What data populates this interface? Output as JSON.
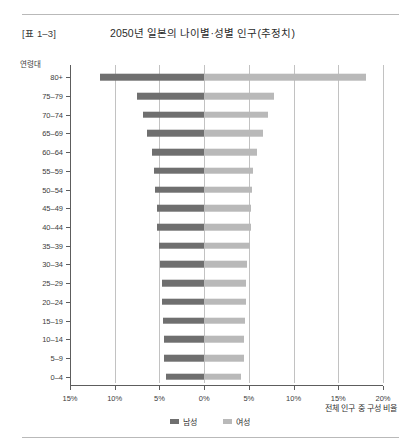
{
  "header": {
    "table_number": "[표 1–3]",
    "title": "2050년 일본의 나이별·성별 인구(추정치)"
  },
  "axis": {
    "ylabel": "연령대",
    "xlabel": "전체 인구 중 구성 비율"
  },
  "legend": {
    "male_label": "남성",
    "female_label": "여성",
    "male_color": "#6f6f6f",
    "female_color": "#b9b9b9"
  },
  "chart_data": {
    "type": "bar",
    "subtype": "population-pyramid",
    "title": "2050년 일본의 나이별·성별 인구(추정치)",
    "xlabel": "전체 인구 중 구성 비율",
    "ylabel": "연령대",
    "grid": true,
    "legend_position": "bottom-center",
    "x_tick_labels": [
      "15%",
      "10%",
      "5%",
      "0%",
      "5%",
      "10%",
      "15%",
      "20%"
    ],
    "x_tick_values": [
      -15,
      -10,
      -5,
      0,
      5,
      10,
      15,
      20
    ],
    "xlim": [
      -15,
      20
    ],
    "units": "percent of total population",
    "categories": [
      "80+",
      "75–79",
      "70–74",
      "65–69",
      "60–64",
      "55–59",
      "50–54",
      "45–49",
      "40–44",
      "35–39",
      "30–34",
      "25–29",
      "20–24",
      "15–19",
      "10–14",
      "5–9",
      "0–4"
    ],
    "series": [
      {
        "name": "남성",
        "color": "#6f6f6f",
        "direction": "left",
        "values": [
          11.7,
          7.5,
          6.8,
          6.4,
          5.8,
          5.6,
          5.5,
          5.3,
          5.3,
          5.1,
          4.9,
          4.7,
          4.7,
          4.6,
          4.5,
          4.5,
          4.3
        ]
      },
      {
        "name": "여성",
        "color": "#b9b9b9",
        "direction": "right",
        "values": [
          18.1,
          7.8,
          7.1,
          6.6,
          5.9,
          5.5,
          5.3,
          5.2,
          5.2,
          5.1,
          4.8,
          4.7,
          4.7,
          4.6,
          4.5,
          4.5,
          4.1
        ]
      }
    ]
  }
}
